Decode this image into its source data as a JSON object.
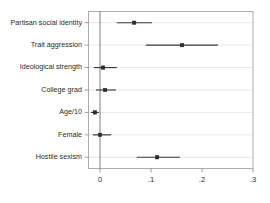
{
  "chart_data": {
    "type": "scatter",
    "subtype": "coefficient-forest-plot",
    "title": "",
    "xlabel": "",
    "ylabel": "",
    "xlim": [
      -0.035,
      0.31
    ],
    "xticks": [
      0,
      0.1,
      0.2,
      0.3
    ],
    "xtick_labels": [
      "0",
      ".1",
      ".2",
      ".3"
    ],
    "grid": true,
    "grid_axis": "y",
    "legend": "none",
    "reference_line": 0,
    "categories": [
      "Partisan social identity",
      "Trait aggression",
      "Ideological strength",
      "College grad",
      "Age/10",
      "Female",
      "Hostile sexism"
    ],
    "values": [
      0.067,
      0.161,
      0.006,
      0.01,
      -0.01,
      0.0,
      0.112
    ],
    "ci_low": [
      0.033,
      0.09,
      -0.012,
      -0.008,
      -0.018,
      -0.014,
      0.072
    ],
    "ci_high": [
      0.102,
      0.231,
      0.033,
      0.031,
      -0.002,
      0.022,
      0.157
    ],
    "points": [
      {
        "label": "Partisan social identity",
        "estimate": 0.067,
        "ci_low": 0.033,
        "ci_high": 0.102
      },
      {
        "label": "Trait aggression",
        "estimate": 0.161,
        "ci_low": 0.09,
        "ci_high": 0.231
      },
      {
        "label": "Ideological strength",
        "estimate": 0.006,
        "ci_low": -0.012,
        "ci_high": 0.033
      },
      {
        "label": "College grad",
        "estimate": 0.01,
        "ci_low": -0.008,
        "ci_high": 0.031
      },
      {
        "label": "Age/10",
        "estimate": -0.01,
        "ci_low": -0.018,
        "ci_high": -0.002
      },
      {
        "label": "Female",
        "estimate": 0.0,
        "ci_low": -0.014,
        "ci_high": 0.022
      },
      {
        "label": "Hostile sexism",
        "estimate": 0.112,
        "ci_low": 0.072,
        "ci_high": 0.157
      }
    ],
    "colors": {
      "marker": "#2a2a2a",
      "ci": "#3a3a3a",
      "grid": "#d8d8d8",
      "axis": "#8a8a8a",
      "zero_line": "#6e6e6e",
      "background": "#ffffff"
    }
  }
}
